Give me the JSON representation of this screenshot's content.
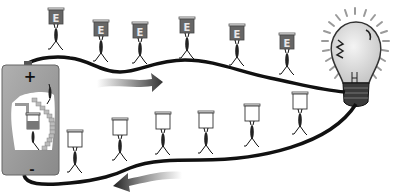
{
  "diagram": {
    "title": "Electric circuit energy carriers",
    "battery": {
      "positive_label": "+",
      "negative_label": "-",
      "body_color": "#9a9a9a"
    },
    "energy_box_label": "E",
    "energy_box_color": "#666666",
    "wire_color": "#111111",
    "arrow_color": "#333333",
    "carriers_top": [
      {
        "x": 56,
        "y": 8,
        "carrying": "E"
      },
      {
        "x": 101,
        "y": 20,
        "carrying": "E"
      },
      {
        "x": 140,
        "y": 22,
        "carrying": "E"
      },
      {
        "x": 187,
        "y": 17,
        "carrying": "E"
      },
      {
        "x": 237,
        "y": 24,
        "carrying": "E"
      },
      {
        "x": 287,
        "y": 33,
        "carrying": "E"
      }
    ],
    "carriers_bottom": [
      {
        "x": 75,
        "y": 130,
        "carrying": "empty"
      },
      {
        "x": 120,
        "y": 118,
        "carrying": "empty"
      },
      {
        "x": 163,
        "y": 112,
        "carrying": "empty"
      },
      {
        "x": 206,
        "y": 111,
        "carrying": "empty"
      },
      {
        "x": 252,
        "y": 104,
        "carrying": "empty"
      },
      {
        "x": 300,
        "y": 92,
        "carrying": "empty"
      }
    ],
    "arrows": [
      {
        "name": "current-direction-top",
        "direction": "right"
      },
      {
        "name": "current-direction-bottom",
        "direction": "left"
      }
    ],
    "bulb": {
      "state": "lit"
    }
  }
}
